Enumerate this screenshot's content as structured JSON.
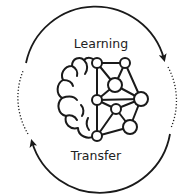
{
  "diagram": {
    "labels": {
      "top": "Learning",
      "bottom": "Transfer"
    },
    "colors": {
      "stroke": "#1a1a1a",
      "background": "#ffffff"
    },
    "icons": {
      "center": "brain-network-icon",
      "cycle": "circular-arrows-icon"
    }
  }
}
